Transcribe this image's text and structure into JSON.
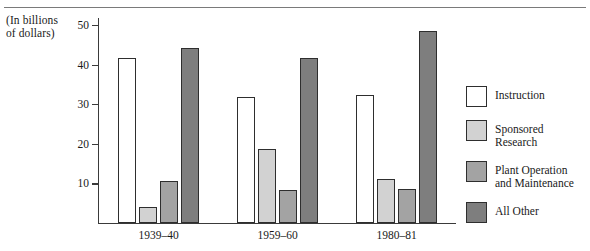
{
  "figure": {
    "axis_caption": "(In billions\nof dollars)",
    "axis_caption_line1": "(In billions",
    "axis_caption_line2": "of dollars)"
  },
  "legend": {
    "items": [
      {
        "label": "Instruction",
        "color": "#ffffff"
      },
      {
        "label": "Sponsored\nResearch",
        "label_line1": "Sponsored",
        "label_line2": "Research",
        "color": "#d2d2d2"
      },
      {
        "label": "Plant Operation\nand Maintenance",
        "label_line1": "Plant Operation",
        "label_line2": "and Maintenance",
        "color": "#a3a3a3"
      },
      {
        "label": "All Other",
        "color": "#7e7e7e"
      }
    ]
  },
  "chart_data": {
    "type": "bar",
    "title": "",
    "subtitle": "",
    "xlabel": "",
    "ylabel": "(In billions of dollars)",
    "ylim": [
      0,
      52
    ],
    "yticks": [
      10,
      20,
      30,
      40,
      50
    ],
    "ytick_labels": [
      "10",
      "20",
      "30",
      "40",
      "50"
    ],
    "grid": false,
    "legend_position": "right",
    "categories": [
      "1939–40",
      "1959–60",
      "1980–81"
    ],
    "series": [
      {
        "name": "Instruction",
        "color": "#ffffff",
        "values": [
          41.5,
          31.8,
          32.3
        ]
      },
      {
        "name": "Sponsored Research",
        "color": "#d2d2d2",
        "values": [
          4.0,
          18.6,
          11.0
        ]
      },
      {
        "name": "Plant Operation and Maintenance",
        "color": "#a3a3a3",
        "values": [
          10.5,
          8.3,
          8.5
        ]
      },
      {
        "name": "All Other",
        "color": "#7e7e7e",
        "values": [
          44.0,
          41.5,
          48.5
        ]
      }
    ]
  }
}
